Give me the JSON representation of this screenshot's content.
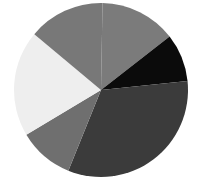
{
  "chart_data": {
    "type": "pie",
    "title": "",
    "legend": [],
    "labels": [
      "Slice A",
      "Slice B",
      "Slice C",
      "Slice D",
      "Slice E",
      "Slice F"
    ],
    "values": [
      14.2,
      8.9,
      32.8,
      10.3,
      19.7,
      14.2
    ],
    "start_angle_deg": 1,
    "direction": "clockwise",
    "colors": [
      "#7b7b7b",
      "#0b0b0b",
      "#3b3b3b",
      "#6f6f6f",
      "#eeeeee",
      "#787878"
    ],
    "center": [
      101,
      90
    ],
    "radius": 87
  }
}
